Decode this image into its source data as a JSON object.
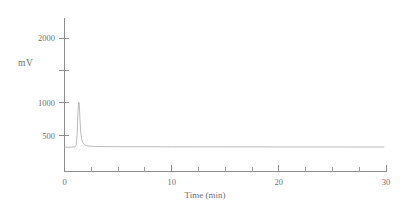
{
  "chart_data": {
    "type": "line",
    "title": "",
    "xlabel": "Time (min)",
    "ylabel": "mV",
    "xlim": [
      0,
      30
    ],
    "ylim": [
      200,
      2400
    ],
    "grid": false,
    "legend": null,
    "x_ticks_major": [
      0,
      10,
      20,
      30
    ],
    "x_tick_labels": [
      "0",
      "10",
      "20",
      "30"
    ],
    "x_ticks_minor": [
      2.5,
      5,
      7.5,
      12.5,
      15,
      17.5,
      22.5,
      25,
      27.5
    ],
    "y_ticks": [
      500,
      1000,
      1500,
      2000
    ],
    "y_tick_labels": [
      "500",
      "1000",
      "",
      "2000"
    ],
    "series": [
      {
        "name": "detector-signal",
        "units": "mV",
        "baseline": 320,
        "peaks": [
          {
            "retention_time": 1.35,
            "height": 1010,
            "width_min": 0.18
          }
        ],
        "x": [
          0.0,
          0.2,
          0.4,
          0.6,
          0.8,
          1.0,
          1.1,
          1.18,
          1.26,
          1.32,
          1.35,
          1.38,
          1.44,
          1.52,
          1.62,
          1.75,
          1.9,
          2.1,
          2.4,
          2.8,
          3.4,
          4.0,
          5.0,
          6.5,
          8.0,
          10.0,
          12.5,
          15.0,
          17.5,
          20.0,
          22.5,
          25.0,
          27.5,
          29.0,
          29.8
        ],
        "y": [
          318,
          318,
          318,
          319,
          320,
          326,
          360,
          520,
          880,
          1000,
          1010,
          975,
          760,
          540,
          430,
          378,
          352,
          340,
          333,
          330,
          328,
          327,
          326,
          325,
          325,
          324,
          324,
          323,
          323,
          322,
          322,
          322,
          321,
          321,
          321
        ]
      }
    ]
  },
  "axis_labels": {
    "y_axis_caption": "mV",
    "x_axis_caption": "Time (min)"
  },
  "colors": {
    "trace": "#a9a9a9",
    "axis": "#8d8d8d",
    "text": "#6f6f6f",
    "background": "#ffffff"
  }
}
